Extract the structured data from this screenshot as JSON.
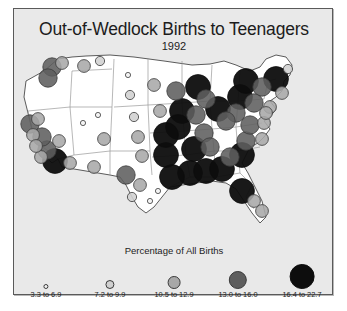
{
  "chart_data": {
    "type": "map",
    "title": "Out-of-Wedlock Births to Teenagers",
    "subtitle": "1992",
    "legend_title": "Percentage of All Births",
    "legend_position": "bottom",
    "symbol": "proportional-circle",
    "value_unit": "percent",
    "legend": [
      {
        "label": "3.3 to 6.9",
        "min": 3.3,
        "max": 6.9,
        "radius": 2.6,
        "fill": "#f2f2f2",
        "stroke": "#3a3a3a"
      },
      {
        "label": "7.2 to 9.9",
        "min": 7.2,
        "max": 9.9,
        "radius": 4.6,
        "fill": "#d0d0d0",
        "stroke": "#3a3a3a"
      },
      {
        "label": "10.5 to 12.9",
        "min": 10.5,
        "max": 12.9,
        "radius": 6.4,
        "fill": "#a8a8a8",
        "stroke": "#3a3a3a"
      },
      {
        "label": "13.0 to 16.0",
        "min": 13.0,
        "max": 16.0,
        "radius": 9.2,
        "fill": "#5e5e5e",
        "stroke": "#3a3a3a"
      },
      {
        "label": "16.4 to 22.7",
        "min": 16.4,
        "max": 22.7,
        "radius": 12.4,
        "fill": "#0d0d0d",
        "stroke": "#0d0d0d"
      }
    ],
    "colors": {
      "background": "#e9e9e9",
      "page": "#ffffff",
      "frame_border": "#5a5a5a",
      "land": "#ffffff",
      "state_border": "#9a9a9a",
      "coast_border": "#4a4a4a",
      "text": "#1c1c1c"
    },
    "points": [
      {
        "state": "WA",
        "x": 38,
        "y": 16,
        "value": 13.5,
        "class": 4
      },
      {
        "state": "WA2",
        "x": 48,
        "y": 12,
        "value": 11.0,
        "class": 3
      },
      {
        "state": "OR",
        "x": 34,
        "y": 27,
        "value": 13.2,
        "class": 4
      },
      {
        "state": "ID",
        "x": 70,
        "y": 15,
        "value": 11.2,
        "class": 3
      },
      {
        "state": "MT",
        "x": 86,
        "y": 10,
        "value": 9.4,
        "class": 2
      },
      {
        "state": "CA1",
        "x": 16,
        "y": 73,
        "value": 14.6,
        "class": 4
      },
      {
        "state": "CA2",
        "x": 24,
        "y": 68,
        "value": 11.8,
        "class": 3
      },
      {
        "state": "CA3",
        "x": 19,
        "y": 84,
        "value": 12.4,
        "class": 3
      },
      {
        "state": "CA4",
        "x": 28,
        "y": 86,
        "value": 13.9,
        "class": 4
      },
      {
        "state": "CA5",
        "x": 22,
        "y": 95,
        "value": 10.9,
        "class": 3
      },
      {
        "state": "CA6",
        "x": 33,
        "y": 99,
        "value": 14.1,
        "class": 4
      },
      {
        "state": "CA7",
        "x": 27,
        "y": 106,
        "value": 12.0,
        "class": 3
      },
      {
        "state": "CA8",
        "x": 41,
        "y": 110,
        "value": 17.3,
        "class": 5
      },
      {
        "state": "NV",
        "x": 45,
        "y": 90,
        "value": 12.6,
        "class": 3
      },
      {
        "state": "AZ",
        "x": 56,
        "y": 112,
        "value": 11.4,
        "class": 3
      },
      {
        "state": "UT",
        "x": 69,
        "y": 72,
        "value": 4.6,
        "class": 1
      },
      {
        "state": "CO",
        "x": 90,
        "y": 88,
        "value": 12.2,
        "class": 3
      },
      {
        "state": "NM",
        "x": 80,
        "y": 116,
        "value": 12.8,
        "class": 3
      },
      {
        "state": "WY",
        "x": 84,
        "y": 64,
        "value": 5.1,
        "class": 1
      },
      {
        "state": "ND",
        "x": 114,
        "y": 24,
        "value": 6.2,
        "class": 1
      },
      {
        "state": "SD",
        "x": 116,
        "y": 44,
        "value": 7.8,
        "class": 2
      },
      {
        "state": "NE",
        "x": 120,
        "y": 66,
        "value": 9.1,
        "class": 2
      },
      {
        "state": "KS",
        "x": 124,
        "y": 86,
        "value": 10.7,
        "class": 3
      },
      {
        "state": "OK",
        "x": 128,
        "y": 105,
        "value": 12.3,
        "class": 3
      },
      {
        "state": "TX1",
        "x": 112,
        "y": 124,
        "value": 13.1,
        "class": 4
      },
      {
        "state": "TX2",
        "x": 126,
        "y": 134,
        "value": 12.9,
        "class": 3
      },
      {
        "state": "TX3",
        "x": 118,
        "y": 146,
        "value": 9.6,
        "class": 2
      },
      {
        "state": "TX4",
        "x": 136,
        "y": 150,
        "value": 6.5,
        "class": 1
      },
      {
        "state": "TX5",
        "x": 144,
        "y": 140,
        "value": 6.8,
        "class": 1
      },
      {
        "state": "MN",
        "x": 140,
        "y": 34,
        "value": 10.4,
        "class": 3
      },
      {
        "state": "IA",
        "x": 146,
        "y": 60,
        "value": 12.5,
        "class": 3
      },
      {
        "state": "MO",
        "x": 152,
        "y": 84,
        "value": 16.8,
        "class": 5
      },
      {
        "state": "AR",
        "x": 152,
        "y": 104,
        "value": 18.2,
        "class": 5
      },
      {
        "state": "LA",
        "x": 158,
        "y": 126,
        "value": 20.4,
        "class": 5
      },
      {
        "state": "WI",
        "x": 162,
        "y": 40,
        "value": 13.8,
        "class": 4
      },
      {
        "state": "IL1",
        "x": 168,
        "y": 60,
        "value": 19.1,
        "class": 5
      },
      {
        "state": "IL2",
        "x": 164,
        "y": 76,
        "value": 17.6,
        "class": 5
      },
      {
        "state": "MS",
        "x": 176,
        "y": 122,
        "value": 22.7,
        "class": 5
      },
      {
        "state": "AL",
        "x": 192,
        "y": 120,
        "value": 20.1,
        "class": 5
      },
      {
        "state": "TN1",
        "x": 180,
        "y": 98,
        "value": 16.9,
        "class": 5
      },
      {
        "state": "TN2",
        "x": 196,
        "y": 96,
        "value": 13.4,
        "class": 4
      },
      {
        "state": "KY",
        "x": 190,
        "y": 82,
        "value": 14.2,
        "class": 4
      },
      {
        "state": "IN",
        "x": 182,
        "y": 64,
        "value": 15.3,
        "class": 4
      },
      {
        "state": "MI1",
        "x": 184,
        "y": 36,
        "value": 18.6,
        "class": 5
      },
      {
        "state": "MI2",
        "x": 192,
        "y": 48,
        "value": 14.8,
        "class": 4
      },
      {
        "state": "OH1",
        "x": 204,
        "y": 58,
        "value": 17.9,
        "class": 5
      },
      {
        "state": "OH2",
        "x": 212,
        "y": 70,
        "value": 13.6,
        "class": 4
      },
      {
        "state": "GA1",
        "x": 208,
        "y": 118,
        "value": 19.4,
        "class": 5
      },
      {
        "state": "GA2",
        "x": 216,
        "y": 106,
        "value": 14.4,
        "class": 4
      },
      {
        "state": "FL1",
        "x": 228,
        "y": 140,
        "value": 16.5,
        "class": 5
      },
      {
        "state": "FL2",
        "x": 240,
        "y": 150,
        "value": 12.1,
        "class": 3
      },
      {
        "state": "FL3",
        "x": 248,
        "y": 160,
        "value": 10.6,
        "class": 3
      },
      {
        "state": "SC",
        "x": 228,
        "y": 104,
        "value": 18.8,
        "class": 5
      },
      {
        "state": "NC1",
        "x": 232,
        "y": 90,
        "value": 15.9,
        "class": 4
      },
      {
        "state": "NC2",
        "x": 248,
        "y": 88,
        "value": 12.7,
        "class": 3
      },
      {
        "state": "VA1",
        "x": 236,
        "y": 74,
        "value": 13.3,
        "class": 4
      },
      {
        "state": "VA2",
        "x": 250,
        "y": 72,
        "value": 11.6,
        "class": 3
      },
      {
        "state": "WV",
        "x": 222,
        "y": 62,
        "value": 14.0,
        "class": 4
      },
      {
        "state": "PA1",
        "x": 226,
        "y": 46,
        "value": 17.1,
        "class": 5
      },
      {
        "state": "PA2",
        "x": 240,
        "y": 52,
        "value": 13.7,
        "class": 4
      },
      {
        "state": "NY1",
        "x": 232,
        "y": 30,
        "value": 16.4,
        "class": 5
      },
      {
        "state": "NY2",
        "x": 248,
        "y": 36,
        "value": 15.0,
        "class": 4
      },
      {
        "state": "NJ",
        "x": 256,
        "y": 56,
        "value": 12.2,
        "class": 3
      },
      {
        "state": "MD",
        "x": 252,
        "y": 62,
        "value": 11.1,
        "class": 3
      },
      {
        "state": "NE1",
        "x": 262,
        "y": 28,
        "value": 17.4,
        "class": 5
      },
      {
        "state": "NE2",
        "x": 268,
        "y": 42,
        "value": 12.6,
        "class": 3
      },
      {
        "state": "ME",
        "x": 274,
        "y": 18,
        "value": 9.8,
        "class": 2
      }
    ]
  }
}
